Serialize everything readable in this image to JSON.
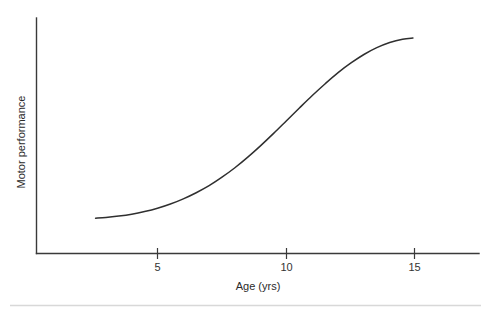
{
  "figure": {
    "background_color": "#ffffff",
    "axis_color": "#3a3a3a",
    "curve_color": "#2f2f2f",
    "divider_color": "#d8d8d8"
  },
  "chart_data": {
    "type": "line",
    "title": "",
    "subtitle": "",
    "xlabel": "Age (yrs)",
    "ylabel": "Motor performance",
    "xlim": [
      2.0,
      17.2
    ],
    "ylim": [
      0,
      100
    ],
    "grid": false,
    "legend": null,
    "legend_position": "none",
    "xticks": [
      5,
      10,
      15
    ],
    "xtick_labels": [
      "5",
      "10",
      "15"
    ],
    "yticks": [],
    "ytick_labels": [],
    "annotations": [],
    "series": [
      {
        "name": "Motor performance",
        "x": [
          2.6,
          3.0,
          3.5,
          4.0,
          4.5,
          5.0,
          5.5,
          6.0,
          6.5,
          7.0,
          7.5,
          8.0,
          8.5,
          9.0,
          9.5,
          10.0,
          10.5,
          11.0,
          11.5,
          12.0,
          12.5,
          13.0,
          13.5,
          14.0,
          14.5,
          14.9
        ],
        "y": [
          15.0,
          15.3,
          15.9,
          16.7,
          17.8,
          19.2,
          21.0,
          23.2,
          25.8,
          28.8,
          32.4,
          36.4,
          40.9,
          45.8,
          51.0,
          56.4,
          61.8,
          67.1,
          72.1,
          76.8,
          80.9,
          84.5,
          87.4,
          89.6,
          91.0,
          91.5
        ]
      }
    ]
  },
  "labels": {
    "x_axis_title": "Age (yrs)",
    "y_axis_title": "Motor performance",
    "xtick_5": "5",
    "xtick_10": "10",
    "xtick_15": "15"
  }
}
